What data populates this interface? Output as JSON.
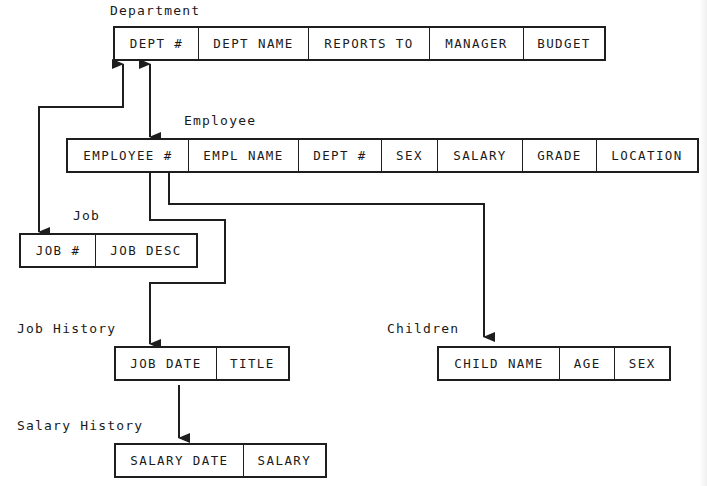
{
  "diagram": {
    "type": "relational schema / entity relationship diagram",
    "entities": [
      {
        "id": "department",
        "title": "Department",
        "fields": [
          "DEPT #",
          "DEPT NAME",
          "REPORTS TO",
          "MANAGER",
          "BUDGET"
        ]
      },
      {
        "id": "employee",
        "title": "Employee",
        "fields": [
          "EMPLOYEE #",
          "EMPL NAME",
          "DEPT #",
          "SEX",
          "SALARY",
          "GRADE",
          "LOCATION"
        ]
      },
      {
        "id": "job",
        "title": "Job",
        "fields": [
          "JOB #",
          "JOB DESC"
        ]
      },
      {
        "id": "job_history",
        "title": "Job History",
        "fields": [
          "JOB DATE",
          "TITLE"
        ]
      },
      {
        "id": "children",
        "title": "Children",
        "fields": [
          "CHILD NAME",
          "AGE",
          "SEX"
        ]
      },
      {
        "id": "salary_history",
        "title": "Salary History",
        "fields": [
          "SALARY DATE",
          "SALARY"
        ]
      }
    ],
    "relationships": [
      {
        "from": "department",
        "to": "job",
        "arrow": "both",
        "route": "elbow-left"
      },
      {
        "from": "department",
        "to": "employee",
        "arrow": "both",
        "route": "vertical"
      },
      {
        "from": "employee",
        "to": "job_history",
        "arrow": "to",
        "route": "elbow"
      },
      {
        "from": "employee",
        "to": "children",
        "arrow": "to",
        "route": "elbow-right"
      },
      {
        "from": "job_history",
        "to": "salary_history",
        "arrow": "to",
        "route": "vertical"
      }
    ],
    "colors": {
      "line": "#1e1e1e",
      "background": "#ffffff"
    }
  }
}
